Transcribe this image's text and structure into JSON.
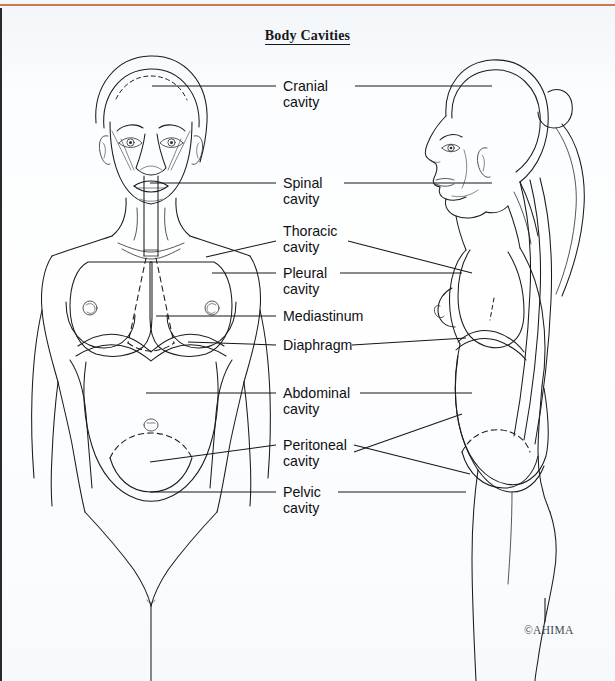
{
  "figure": {
    "title": "Body Cavities",
    "credit": "©AHIMA",
    "accent_color": "#c9794b",
    "ink_color": "#16161a",
    "background_color": "#fdfeff"
  },
  "views": [
    {
      "name": "anterior-female-figure",
      "orientation": "frontal"
    },
    {
      "name": "lateral-female-figure",
      "orientation": "left-facing profile"
    }
  ],
  "labels": [
    {
      "id": "cranial",
      "line1": "Cranial",
      "line2": "cavity"
    },
    {
      "id": "spinal",
      "line1": "Spinal",
      "line2": "cavity"
    },
    {
      "id": "thoracic",
      "line1": "Thoracic",
      "line2": "cavity"
    },
    {
      "id": "pleural",
      "line1": "Pleural",
      "line2": "cavity"
    },
    {
      "id": "mediastinum",
      "line1": "Mediastinum",
      "line2": ""
    },
    {
      "id": "diaphragm",
      "line1": "Diaphragm",
      "line2": ""
    },
    {
      "id": "abdominal",
      "line1": "Abdominal",
      "line2": "cavity"
    },
    {
      "id": "peritoneal",
      "line1": "Peritoneal",
      "line2": "cavity"
    },
    {
      "id": "pelvic",
      "line1": "Pelvic",
      "line2": "cavity"
    }
  ]
}
